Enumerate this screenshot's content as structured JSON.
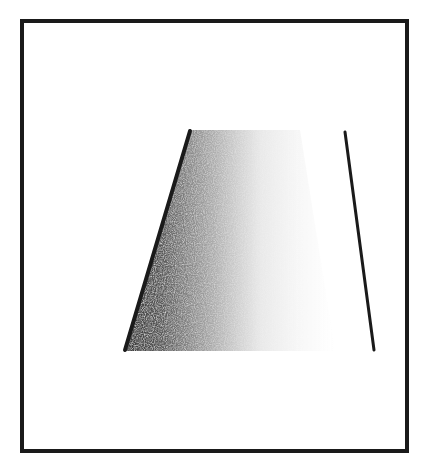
{
  "figure": {
    "width": 427,
    "height": 468,
    "background": "#ffffff",
    "ink": "#1a1a1a",
    "frame": {
      "x": 22,
      "y": 21,
      "w": 385,
      "h": 430,
      "stroke_width": 4
    },
    "shaded_region": {
      "shape": "trapezoid",
      "points": "190,130 300,130 330,351 124,351",
      "gradient": "dark-left-to-light-right"
    },
    "lines": [
      {
        "name": "left-edge-line",
        "x1": 190,
        "y1": 131,
        "x2": 125,
        "y2": 350,
        "width": 4
      },
      {
        "name": "right-edge-line",
        "x1": 345,
        "y1": 132,
        "x2": 374,
        "y2": 350,
        "width": 3
      }
    ]
  }
}
